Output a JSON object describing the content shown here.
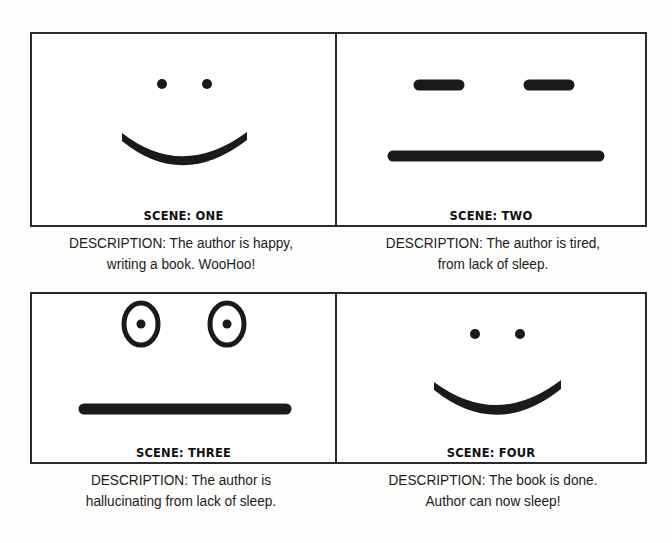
{
  "storyboard": {
    "scenes": [
      {
        "label": "SCENE: ONE",
        "face": "happy",
        "description_line1": "DESCRIPTION: The author is happy,",
        "description_line2": "writing a book.  WooHoo!"
      },
      {
        "label": "SCENE: TWO",
        "face": "tired",
        "description_line1": "DESCRIPTION: The author is tired,",
        "description_line2": "from lack of sleep."
      },
      {
        "label": "SCENE: THREE",
        "face": "hallucinating",
        "description_line1": "DESCRIPTION: The author is",
        "description_line2": "hallucinating from lack of sleep."
      },
      {
        "label": "SCENE: FOUR",
        "face": "happy",
        "description_line1": "DESCRIPTION: The book is done.",
        "description_line2": "Author can now sleep!"
      }
    ],
    "colors": {
      "ink": "#1a1a1a",
      "border": "#2a2a2a",
      "background": "#ffffff"
    }
  }
}
